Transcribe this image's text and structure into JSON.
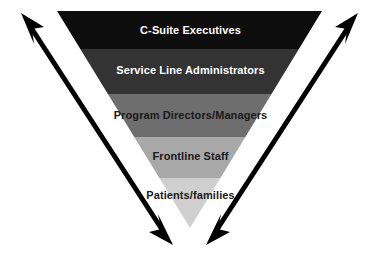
{
  "diagram": {
    "type": "inverted-pyramid",
    "background_color": "#ffffff",
    "apex": {
      "x": 190,
      "y": 228
    },
    "top_left": {
      "x": 57,
      "y": 11
    },
    "top_right": {
      "x": 322,
      "y": 11
    },
    "tiers": [
      {
        "label": "C-Suite Executives",
        "fill": "#0d0d0d",
        "text_color": "#ffffff",
        "text_tone": "light",
        "y_top": 11,
        "y_bottom": 49
      },
      {
        "label": "Service Line Administrators",
        "fill": "#333333",
        "text_color": "#ffffff",
        "text_tone": "light",
        "y_top": 49,
        "y_bottom": 94
      },
      {
        "label": "Program Directors/Managers",
        "fill": "#6e6e6e",
        "text_color": "#1a1a1a",
        "text_tone": "dark",
        "y_top": 94,
        "y_bottom": 137
      },
      {
        "label": "Frontline Staff",
        "fill": "#a8a8a8",
        "text_color": "#1a1a1a",
        "text_tone": "dark",
        "y_top": 137,
        "y_bottom": 178
      },
      {
        "label": "Patients/families",
        "fill": "#cfcfcf",
        "text_color": "#1a1a1a",
        "text_tone": "dark",
        "y_top": 178,
        "y_bottom": 228
      }
    ],
    "arrows": {
      "color": "#000000",
      "stroke_width": 5,
      "items": [
        {
          "name": "arrow-left-diagonal",
          "description": "double-headed arrow from upper-left to lower-right",
          "start": {
            "x": 24,
            "y": 17
          },
          "end": {
            "x": 170,
            "y": 241
          }
        },
        {
          "name": "arrow-right-diagonal",
          "description": "double-headed arrow from upper-right to lower-left",
          "start": {
            "x": 355,
            "y": 17
          },
          "end": {
            "x": 209,
            "y": 241
          }
        }
      ]
    }
  }
}
